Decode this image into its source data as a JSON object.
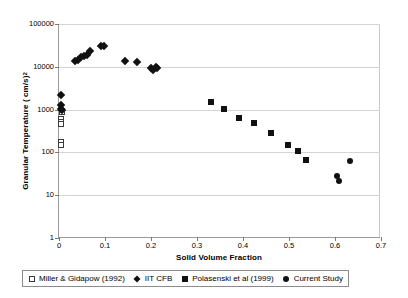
{
  "chart_data": {
    "type": "scatter",
    "title": "",
    "xlabel": "Solid Volume Fraction",
    "ylabel": "Granular Temperature ( cm/s)",
    "ylabel_exponent": "2",
    "xlim": [
      0,
      0.7
    ],
    "ylim": [
      1,
      100000
    ],
    "yscale": "log",
    "xscale": "linear",
    "grid": "horizontal",
    "legend_position": "below",
    "xticks": [
      "0",
      "0.1",
      "0.2",
      "0.3",
      "0.4",
      "0.5",
      "0.6",
      "0.7"
    ],
    "xtick_values": [
      0,
      0.1,
      0.2,
      0.3,
      0.4,
      0.5,
      0.6,
      0.7
    ],
    "yticks": [
      "1",
      "10",
      "100",
      "1000",
      "10000",
      "100000"
    ],
    "ytick_values": [
      1,
      10,
      100,
      1000,
      10000,
      100000
    ],
    "series": [
      {
        "name": "Miller & Gidapow (1992)",
        "marker": "open-square",
        "color": "#ffffff",
        "edge_color": "#3a3a3a",
        "points": [
          {
            "x": 0.004,
            "y": 600
          },
          {
            "x": 0.004,
            "y": 520
          },
          {
            "x": 0.004,
            "y": 460
          },
          {
            "x": 0.004,
            "y": 175
          },
          {
            "x": 0.004,
            "y": 150
          },
          {
            "x": 0.006,
            "y": 900
          }
        ]
      },
      {
        "name": "IIT CFB",
        "marker": "diamond",
        "color": "#111111",
        "points": [
          {
            "x": 0.004,
            "y": 2200
          },
          {
            "x": 0.005,
            "y": 1250
          },
          {
            "x": 0.005,
            "y": 1050
          },
          {
            "x": 0.006,
            "y": 980
          },
          {
            "x": 0.035,
            "y": 13500
          },
          {
            "x": 0.042,
            "y": 14500
          },
          {
            "x": 0.048,
            "y": 16500
          },
          {
            "x": 0.055,
            "y": 18000
          },
          {
            "x": 0.06,
            "y": 19000
          },
          {
            "x": 0.068,
            "y": 24000
          },
          {
            "x": 0.092,
            "y": 31000
          },
          {
            "x": 0.098,
            "y": 30000
          },
          {
            "x": 0.143,
            "y": 14000
          },
          {
            "x": 0.17,
            "y": 13000
          },
          {
            "x": 0.2,
            "y": 9200
          },
          {
            "x": 0.205,
            "y": 8600
          },
          {
            "x": 0.21,
            "y": 10000
          },
          {
            "x": 0.213,
            "y": 9600
          }
        ]
      },
      {
        "name": "Polasenski et al (1999)",
        "marker": "filled-square",
        "color": "#111111",
        "points": [
          {
            "x": 0.33,
            "y": 1500
          },
          {
            "x": 0.358,
            "y": 1050
          },
          {
            "x": 0.392,
            "y": 640
          },
          {
            "x": 0.424,
            "y": 480
          },
          {
            "x": 0.46,
            "y": 280
          },
          {
            "x": 0.497,
            "y": 150
          },
          {
            "x": 0.52,
            "y": 110
          },
          {
            "x": 0.538,
            "y": 68
          }
        ]
      },
      {
        "name": "Current Study",
        "marker": "filled-circle",
        "color": "#111111",
        "points": [
          {
            "x": 0.604,
            "y": 28
          },
          {
            "x": 0.608,
            "y": 22
          },
          {
            "x": 0.632,
            "y": 62
          }
        ]
      }
    ]
  },
  "legend": {
    "entries": [
      {
        "label": "Miller & Gidapow (1992)",
        "marker": "open-square"
      },
      {
        "label": "IIT CFB",
        "marker": "diamond"
      },
      {
        "label": "Polasenski et al (1999)",
        "marker": "filled-square"
      },
      {
        "label": "Current Study",
        "marker": "filled-circle"
      }
    ]
  }
}
